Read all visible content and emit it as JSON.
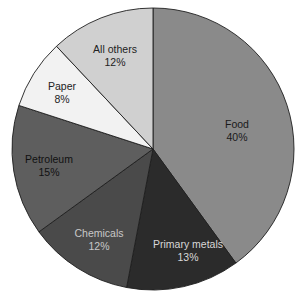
{
  "chart_data": {
    "type": "pie",
    "title": "",
    "start_angle_deg": 0,
    "direction": "clockwise",
    "slices": [
      {
        "label": "Food",
        "value": 40,
        "display": "40%",
        "color": "#8a8a8a",
        "text_color": "#1a1a1a"
      },
      {
        "label": "Primary metals",
        "value": 13,
        "display": "13%",
        "color": "#2b2b2b",
        "text_color": "#d8d8d8"
      },
      {
        "label": "Chemicals",
        "value": 12,
        "display": "12%",
        "color": "#4a4a4a",
        "text_color": "#c8c8c8"
      },
      {
        "label": "Petroleum",
        "value": 15,
        "display": "15%",
        "color": "#5e5e5e",
        "text_color": "#111111"
      },
      {
        "label": "Paper",
        "value": 8,
        "display": "8%",
        "color": "#f2f2f2",
        "text_color": "#222222"
      },
      {
        "label": "All others",
        "value": 12,
        "display": "12%",
        "color": "#d0d0d0",
        "text_color": "#222222"
      }
    ],
    "legend": "none (labels inside slices)",
    "units": "%"
  },
  "layout": {
    "cx": 153,
    "cy": 149,
    "r": 141,
    "label_positions": [
      {
        "x": 237,
        "y": 128
      },
      {
        "x": 188,
        "y": 248
      },
      {
        "x": 99,
        "y": 237
      },
      {
        "x": 49,
        "y": 163
      },
      {
        "x": 62,
        "y": 90
      },
      {
        "x": 115,
        "y": 53
      }
    ]
  }
}
